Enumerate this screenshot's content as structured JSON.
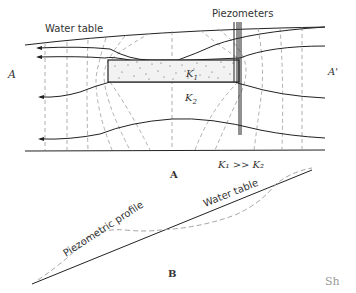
{
  "panel_a": {
    "caption": "A",
    "labels": {
      "water_table": "Water table",
      "piezometers": "Piezometers",
      "left_section": "A",
      "right_section": "A'",
      "k1": "K",
      "k1_sub": "1",
      "k2": "K",
      "k2_sub": "2",
      "relation": "K₁ >> K₂"
    }
  },
  "panel_b": {
    "caption": "B",
    "labels": {
      "water_table": "Water table",
      "piezometric_profile": "Piezometric profile"
    }
  },
  "signature": "Sh",
  "colors": {
    "line": "#222222",
    "dashed": "#9a9a9a",
    "lens_fill": "#f2f2f2"
  }
}
